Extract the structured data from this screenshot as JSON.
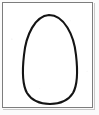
{
  "image": {
    "kind": "line-drawing",
    "subject": "egg",
    "width_px": 99,
    "height_px": 115,
    "background_color": "#fbfbfb",
    "paper_color": "#ffffff"
  },
  "frame": {
    "name": "drawing-frame",
    "border_color": "#7d7d7d",
    "shadow_color": "#c9c9c9",
    "x": 2,
    "y": 2,
    "width": 91,
    "height": 106
  },
  "figure": {
    "name": "egg-outline",
    "stroke_color": "#141414",
    "fill_color": "#ffffff",
    "stroke_width": 2.1,
    "bounds": {
      "left": 22,
      "top": 14,
      "right": 76,
      "bottom": 101
    },
    "path": "M 44 10 C 30 11, 21 30, 19 50 C 17 67, 17 79, 22 88 C 27 96, 35 99, 45 99 C 55 99, 63 96, 68 88 C 73 79, 73 67, 71 50 C 69 30, 59 10, 44 10 Z"
  }
}
